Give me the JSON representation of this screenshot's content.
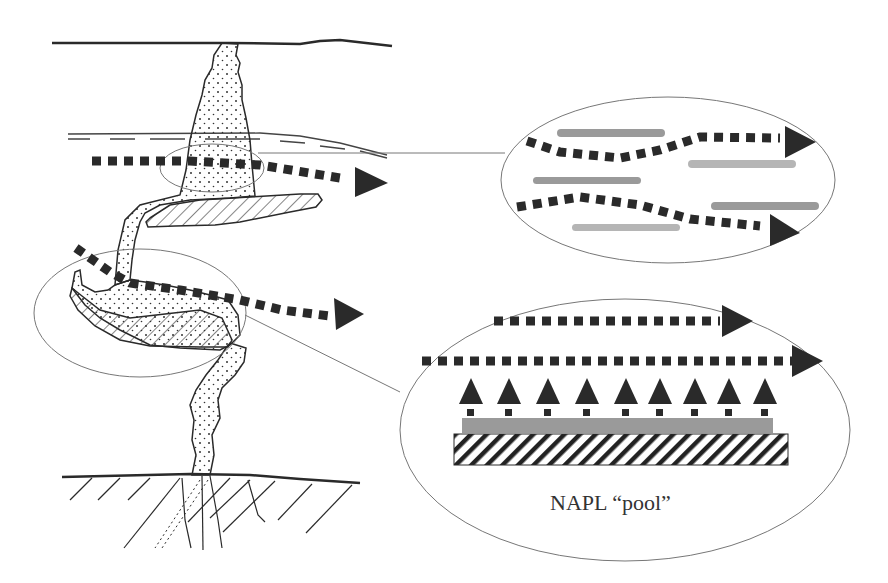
{
  "diagram": {
    "labels": {
      "napl_pool": "NAPL “pool”"
    },
    "colors": {
      "ink": "#2a2a2a",
      "thin_line": "#777777",
      "gray_bar": "#9a9a9a",
      "light_gray_bar": "#b5b5b5",
      "background": "#ffffff"
    },
    "elements": [
      "ground-surface",
      "water-table",
      "napl-plume",
      "napl-lens-upper",
      "napl-lens-lower",
      "bedrock-fractured",
      "groundwater-flow-arrows",
      "zoom-callout-ganglia",
      "zoom-callout-pool"
    ]
  }
}
